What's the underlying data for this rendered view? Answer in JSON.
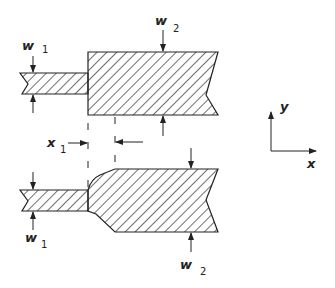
{
  "figure": {
    "top_structure": {
      "narrow_label": "w",
      "narrow_sub": "1",
      "wide_label": "w",
      "wide_sub": "2"
    },
    "offset": {
      "label": "x",
      "sub": "1"
    },
    "bottom_structure": {
      "narrow_label": "w",
      "narrow_sub": "1",
      "wide_label": "w",
      "wide_sub": "2"
    },
    "axes": {
      "y_label": "y",
      "x_label": "x"
    },
    "colors": {
      "ink": "#222222",
      "background": "#ffffff"
    }
  }
}
